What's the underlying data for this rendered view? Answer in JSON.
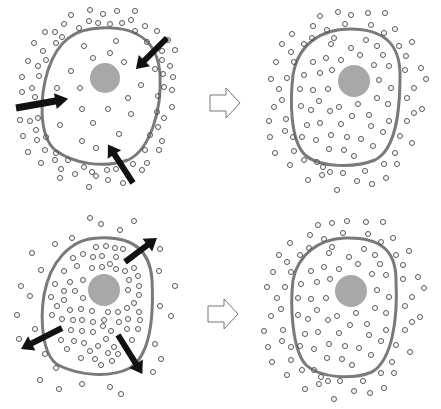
{
  "diagram": {
    "colors": {
      "background": "#ffffff",
      "membrane": "#7a7a7a",
      "nucleus": "#a8a8a8",
      "particle_stroke": "#555555",
      "flux_arrow": "#111111",
      "transition_arrow_stroke": "#777777"
    },
    "panels": [
      {
        "id": "top-left",
        "state": "before",
        "flow": "inward",
        "arrow_count": 3
      },
      {
        "id": "top-right",
        "state": "after",
        "flow": "equilibrium",
        "arrow_count": 0
      },
      {
        "id": "bottom-left",
        "state": "before",
        "flow": "outward",
        "arrow_count": 3
      },
      {
        "id": "bottom-right",
        "state": "after",
        "flow": "equilibrium",
        "arrow_count": 0
      }
    ],
    "transitions": [
      {
        "from": "top-left",
        "to": "top-right",
        "icon": "hollow-right-arrow-icon"
      },
      {
        "from": "bottom-left",
        "to": "bottom-right",
        "icon": "hollow-right-arrow-icon"
      }
    ]
  }
}
